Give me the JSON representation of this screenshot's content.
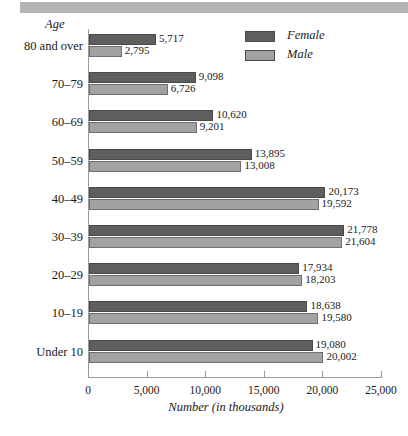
{
  "header": {
    "band_color": "#b3b3b3"
  },
  "chart_data": {
    "type": "bar",
    "orientation": "horizontal",
    "grouped": true,
    "title": "",
    "ylabel": "Age",
    "xlabel": "Number (in thousands)",
    "xlim": [
      0,
      25000
    ],
    "xticks": [
      0,
      5000,
      10000,
      15000,
      20000,
      25000
    ],
    "xtick_labels": [
      "0",
      "5,000",
      "10,000",
      "15,000",
      "20,000",
      "25,000"
    ],
    "grid": false,
    "legend_position": "top-right",
    "categories": [
      "80 and over",
      "70–79",
      "60–69",
      "50–59",
      "40–49",
      "30–39",
      "20–29",
      "10–19",
      "Under 10"
    ],
    "series": [
      {
        "name": "Female",
        "color": "#5e5e5e",
        "values": [
          5717,
          9098,
          10620,
          13895,
          20173,
          21778,
          17934,
          18638,
          19080
        ],
        "value_labels": [
          "5,717",
          "9,098",
          "10,620",
          "13,895",
          "20,173",
          "21,778",
          "17,934",
          "18,638",
          "19,080"
        ]
      },
      {
        "name": "Male",
        "color": "#a2a2a2",
        "values": [
          2795,
          6726,
          9201,
          13008,
          19592,
          21604,
          18203,
          19580,
          20002
        ],
        "value_labels": [
          "2,795",
          "6,726",
          "9,201",
          "13,008",
          "19,592",
          "21,604",
          "18,203",
          "19,580",
          "20,002"
        ]
      }
    ]
  },
  "legend": {
    "items": [
      {
        "label": "Female",
        "color": "#5e5e5e"
      },
      {
        "label": "Male",
        "color": "#a2a2a2"
      }
    ]
  }
}
